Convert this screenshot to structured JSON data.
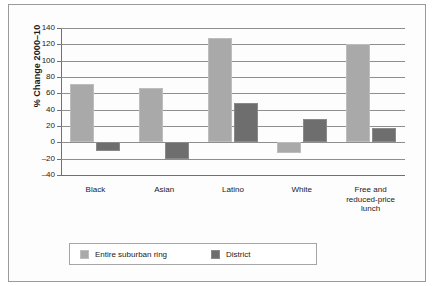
{
  "chart_data": {
    "type": "bar",
    "title": "",
    "subtitle": "",
    "xlabel": "",
    "ylabel": "% Change 2000–10",
    "ylim": [
      -40,
      140
    ],
    "yticks": [
      -40,
      -20,
      0,
      20,
      40,
      60,
      80,
      100,
      120,
      140
    ],
    "ytick_labels": [
      "–40",
      "–20",
      "0",
      "20",
      "40",
      "60",
      "80",
      "100",
      "120",
      "140"
    ],
    "grid": true,
    "legend_position": "bottom-left",
    "categories": [
      "Black",
      "Asian",
      "Latino",
      "White",
      "Free and\nreduced-price\nlunch"
    ],
    "series": [
      {
        "name": "Entire suburban ring",
        "color": "#a9a9a9",
        "values": [
          72,
          66,
          128,
          -13,
          120
        ]
      },
      {
        "name": "District",
        "color": "#6e6e6e",
        "values": [
          -11,
          -20,
          48,
          28,
          17
        ]
      }
    ],
    "annotations": []
  },
  "legend": {
    "entries": [
      {
        "label": "Entire suburban ring",
        "swatch": "series-0"
      },
      {
        "label": "District",
        "swatch": "series-1"
      }
    ]
  },
  "colors": {
    "series_light": "#a9a9a9",
    "series_dark": "#6e6e6e",
    "axis": "#6f6f6f",
    "grid": "#8e8e8e",
    "frame": "#9a9a9a",
    "text": "#1a1a1a"
  }
}
